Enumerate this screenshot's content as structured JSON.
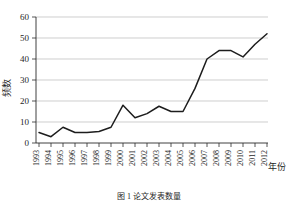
{
  "figure": {
    "caption": "图 1  论文发表数量",
    "y_axis_label": "频数",
    "x_axis_label": "年份"
  },
  "chart_data": {
    "type": "line",
    "title": "图 1  论文发表数量",
    "xlabel": "年份",
    "ylabel": "频数",
    "categories": [
      "1993",
      "1994",
      "1995",
      "1996",
      "1997",
      "1998",
      "1999",
      "2000",
      "2001",
      "2002",
      "2003",
      "2004",
      "2005",
      "2006",
      "2007",
      "2008",
      "2009",
      "2010",
      "2011",
      "2012"
    ],
    "values": [
      5,
      3,
      7.5,
      5,
      5,
      5.5,
      7.5,
      18,
      12,
      14,
      17.5,
      15,
      15,
      26,
      40,
      44,
      44,
      41,
      47,
      52
    ],
    "series": [
      {
        "name": "频数",
        "values": [
          5,
          3,
          7.5,
          5,
          5,
          5.5,
          7.5,
          18,
          12,
          14,
          17.5,
          15,
          15,
          26,
          40,
          44,
          44,
          41,
          47,
          52
        ]
      }
    ],
    "ylim": [
      0,
      60
    ],
    "yticks": [
      0,
      10,
      20,
      30,
      40,
      50,
      60
    ],
    "xticks": [
      "1993",
      "1994",
      "1995",
      "1996",
      "1997",
      "1998",
      "1999",
      "2000",
      "2001",
      "2002",
      "2003",
      "2004",
      "2005",
      "2006",
      "2007",
      "2008",
      "2009",
      "2010",
      "2011",
      "2012"
    ],
    "grid": true,
    "grid_axis": "y",
    "legend": false,
    "line_color": "#1d1d1d",
    "grid_color": "#b9b9b9",
    "axis_color": "#2b2b2b"
  }
}
